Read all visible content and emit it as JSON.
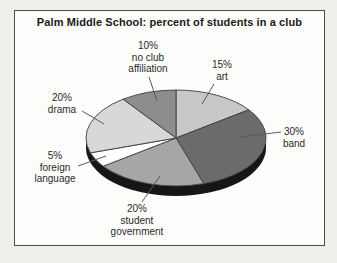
{
  "chart_data": {
    "type": "pie",
    "title": "Palm Middle School: percent of students in a club",
    "unit": "percent of students",
    "order": "clockwise-from-top",
    "legend_position": "none (direct labels with leader lines)",
    "slices": [
      {
        "key": "art",
        "name": "art",
        "value": 15,
        "label": "15%\nart",
        "color": "#c8c8c8",
        "label_pos": {
          "x": 222,
          "y": 59
        },
        "leader": [
          214,
          84,
          202,
          104
        ]
      },
      {
        "key": "band",
        "name": "band",
        "value": 30,
        "label": "30%\nband",
        "color": "#6b6b6b",
        "label_pos": {
          "x": 294,
          "y": 126
        },
        "leader": [
          281,
          132,
          240,
          137
        ]
      },
      {
        "key": "student-government",
        "name": "student government",
        "value": 20,
        "label": "20%\nstudent\ngovernment",
        "color": "#a6a6a6",
        "label_pos": {
          "x": 137,
          "y": 203
        },
        "leader": [
          142,
          202,
          160,
          176
        ]
      },
      {
        "key": "foreign-language",
        "name": "foreign language",
        "value": 5,
        "label": "5%\nforeign\nlanguage",
        "color": "#ffffff",
        "label_pos": {
          "x": 55,
          "y": 150
        },
        "leader": [
          78,
          166,
          106,
          156
        ]
      },
      {
        "key": "drama",
        "name": "drama",
        "value": 20,
        "label": "20%\ndrama",
        "color": "#d8d8d8",
        "label_pos": {
          "x": 62,
          "y": 92
        },
        "leader": [
          82,
          111,
          104,
          124
        ]
      },
      {
        "key": "no-club-affiliation",
        "name": "no club affiliation",
        "value": 10,
        "label": "10%\nno club\naffiliation",
        "color": "#8d8d8d",
        "label_pos": {
          "x": 148,
          "y": 40
        },
        "leader": [
          149,
          77,
          157,
          101
        ]
      }
    ],
    "geometry": {
      "cx": 176,
      "cy": 138,
      "rx": 90,
      "ry": 48,
      "depth": 10,
      "start_angle_deg": 0
    },
    "colors": {
      "rim": "#161616",
      "slice_stroke": "#3d3d3d",
      "leader_line": "#5a5a5a",
      "frame_border": "#4c4c4c"
    }
  }
}
